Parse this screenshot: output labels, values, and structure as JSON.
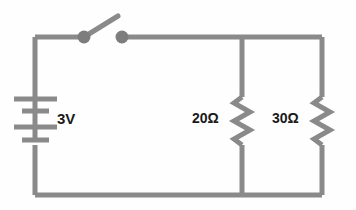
{
  "diagram": {
    "background_color": "#fefefe",
    "wire_color": "#8a8a8a",
    "wire_color_dark": "#7d7d7d",
    "label_color": "#1a1a1a",
    "wire_width": 5
  },
  "components": {
    "battery": {
      "name": "battery",
      "label": "3V",
      "voltage": 3,
      "unit": "V",
      "cells": 2,
      "plates": 4
    },
    "switch": {
      "name": "switch",
      "label": "",
      "state": "open",
      "terminal_radius": 6
    },
    "resistor_1": {
      "name": "resistor-20-ohm",
      "label": "20Ω",
      "value": 20,
      "unit": "Ω"
    },
    "resistor_2": {
      "name": "resistor-30-ohm",
      "label": "30Ω",
      "value": 30,
      "unit": "Ω"
    }
  },
  "geometry": {
    "top_rail_y": 37,
    "bottom_rail_y": 195,
    "left_rail_x": 35,
    "right_rail_x": 322,
    "middle_branch_x": 242,
    "switch_left_terminal_x": 84,
    "switch_right_terminal_x": 122
  }
}
